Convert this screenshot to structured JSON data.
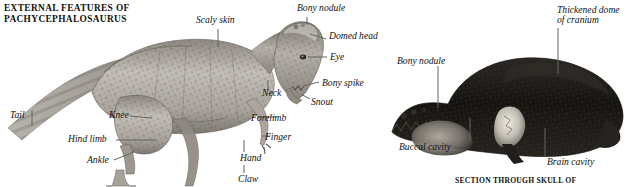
{
  "plate": {
    "title_left": "EXTERNAL FEATURES OF\nPACHYCEPHALOSAURUS",
    "title_bottom": "SECTION THROUGH SKULL OF"
  },
  "figures": [
    {
      "name": "pachycephalosaurus-body",
      "labels": [
        {
          "id": "scaly-skin",
          "text": "Scaly skin",
          "x": 196,
          "y": 15,
          "align": "left"
        },
        {
          "id": "bony-nodule-1",
          "text": "Bony nodule",
          "x": 297,
          "y": 3,
          "align": "left"
        },
        {
          "id": "domed-head",
          "text": "Domed head",
          "x": 329,
          "y": 31,
          "align": "left"
        },
        {
          "id": "eye",
          "text": "Eye",
          "x": 330,
          "y": 52,
          "align": "left"
        },
        {
          "id": "bony-spike",
          "text": "Bony spike",
          "x": 322,
          "y": 78,
          "align": "left"
        },
        {
          "id": "snout",
          "text": "Snout",
          "x": 311,
          "y": 97,
          "align": "left"
        },
        {
          "id": "neck",
          "text": "Neck",
          "x": 262,
          "y": 88,
          "align": "left"
        },
        {
          "id": "forelimb",
          "text": "Forelimb",
          "x": 251,
          "y": 113,
          "align": "left"
        },
        {
          "id": "finger",
          "text": "Finger",
          "x": 265,
          "y": 132,
          "align": "left"
        },
        {
          "id": "hand",
          "text": "Hand",
          "x": 240,
          "y": 153,
          "align": "left"
        },
        {
          "id": "claw",
          "text": "Claw",
          "x": 238,
          "y": 174,
          "align": "left"
        },
        {
          "id": "tail",
          "text": "Tail",
          "x": 10,
          "y": 110,
          "align": "left"
        },
        {
          "id": "knee",
          "text": "Knee",
          "x": 109,
          "y": 110,
          "align": "left"
        },
        {
          "id": "hind-limb",
          "text": "Hind limb",
          "x": 68,
          "y": 134,
          "align": "left"
        },
        {
          "id": "ankle",
          "text": "Ankle",
          "x": 87,
          "y": 155,
          "align": "left"
        }
      ]
    },
    {
      "name": "pachycephalosaurus-skull-section",
      "labels": [
        {
          "id": "thickened-dome",
          "text": "Thickened dome\nof cranium",
          "x": 557,
          "y": 5,
          "align": "left"
        },
        {
          "id": "bony-nodule-2",
          "text": "Bony nodule",
          "x": 397,
          "y": 56,
          "align": "left"
        },
        {
          "id": "buccal-cavity",
          "text": "Buccal cavity",
          "x": 399,
          "y": 142,
          "align": "left"
        },
        {
          "id": "brain-cavity",
          "text": "Brain cavity",
          "x": 547,
          "y": 157,
          "align": "left"
        }
      ]
    }
  ],
  "colors": {
    "background": "#ffffff",
    "text": "#111111",
    "leader_line": "#656565",
    "body_light": "#cfcbc4",
    "body_mid": "#9a958d",
    "body_dark": "#5f5b55",
    "skull_dark": "#1e1c1a",
    "skull_mid": "#6d6962",
    "skull_light": "#c8c3ba"
  }
}
